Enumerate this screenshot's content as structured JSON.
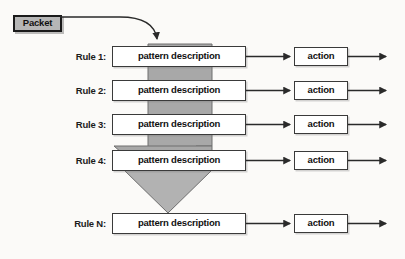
{
  "diagram": {
    "background_color": "#fbfaf8",
    "packet": {
      "label": "Packet",
      "fill_color": "#b6b6b6",
      "border_color": "#1a1a1a",
      "arrow_name": "packet-entry-arrow"
    },
    "funnel": {
      "fill_color": "#a8a8a8",
      "stroke_color": "#6e6e6e",
      "description": "gray funnel narrowing downward through the rules"
    },
    "box_colors": {
      "pattern_fill": "#ffffff",
      "action_fill": "#ffffff",
      "border": "#3a3a3a",
      "text": "#111111"
    },
    "rows": [
      {
        "rule_label": "Rule 1:",
        "pattern_label": "pattern description",
        "action_label": "action"
      },
      {
        "rule_label": "Rule 2:",
        "pattern_label": "pattern description",
        "action_label": "action"
      },
      {
        "rule_label": "Rule 3:",
        "pattern_label": "pattern description",
        "action_label": "action"
      },
      {
        "rule_label": "Rule 4:",
        "pattern_label": "pattern description",
        "action_label": "action"
      },
      {
        "rule_label": "Rule N:",
        "pattern_label": "pattern description",
        "action_label": "action"
      }
    ]
  }
}
